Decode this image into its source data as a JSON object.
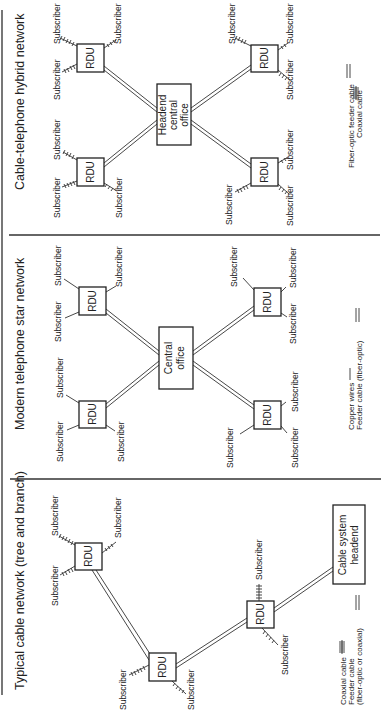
{
  "colors": {
    "ink": "#222222",
    "background": "#ffffff"
  },
  "orientation": "rotated 90deg counter-clockwise",
  "panels": [
    {
      "id": "hybrid",
      "title": "Cable-telephone hybrid network",
      "center_label_1": "Headend",
      "center_label_2": "central",
      "center_label_3": "office",
      "rdu_label": "RDU",
      "subscriber_label": "Subscriber",
      "legend_1": "Fiber-optic feeder cable",
      "legend_2": "Coaxial cable"
    },
    {
      "id": "star",
      "title": "Modern telephone star network",
      "center_label_1": "Central",
      "center_label_2": "office",
      "rdu_label": "RDU",
      "subscriber_label": "Subscriber",
      "legend_1": "Copper wires",
      "legend_2": "Feeder cable (fiber-optic)"
    },
    {
      "id": "tree",
      "title": "Typical cable network (tree and branch)",
      "center_label_1": "Cable system",
      "center_label_2": "headend",
      "rdu_label": "RDU",
      "subscriber_label": "Subscriber",
      "legend_1": "Coaxial cable",
      "legend_2": "Feeder cable",
      "legend_3": "(fiber-optic or coaxial)"
    }
  ]
}
